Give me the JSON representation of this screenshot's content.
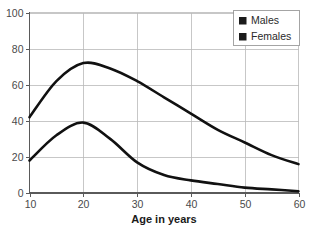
{
  "chart_data": {
    "type": "line",
    "title": "",
    "xlabel": "Age in years",
    "ylabel": "",
    "xlim": [
      10,
      60
    ],
    "ylim": [
      0,
      100
    ],
    "xticks": [
      10,
      20,
      30,
      40,
      50,
      60
    ],
    "yticks": [
      0,
      20,
      40,
      60,
      80,
      100
    ],
    "grid": true,
    "legend_position": "top-right",
    "x": [
      10,
      15,
      20,
      25,
      30,
      35,
      40,
      45,
      50,
      55,
      60
    ],
    "series": [
      {
        "name": "Males",
        "color": "#111111",
        "values": [
          42,
          62,
          72,
          69,
          62,
          53,
          44,
          35,
          28,
          21,
          16
        ]
      },
      {
        "name": "Females",
        "color": "#111111",
        "values": [
          18,
          32,
          39,
          30,
          17,
          10,
          7,
          5,
          3,
          2,
          1
        ]
      }
    ]
  },
  "axes": {
    "x_tick_labels": [
      "10",
      "20",
      "30",
      "40",
      "50",
      "60"
    ],
    "y_tick_labels": [
      "0",
      "20",
      "40",
      "60",
      "80",
      "100"
    ],
    "x_axis_title": "Age in years"
  },
  "legend": {
    "items": [
      {
        "label": "Males"
      },
      {
        "label": "Females"
      }
    ]
  },
  "colors": {
    "line": "#111111",
    "grid": "#b9b9b9",
    "axis": "#5a5a5a",
    "background": "#ffffff",
    "tick_text": "#4a4a4a"
  }
}
